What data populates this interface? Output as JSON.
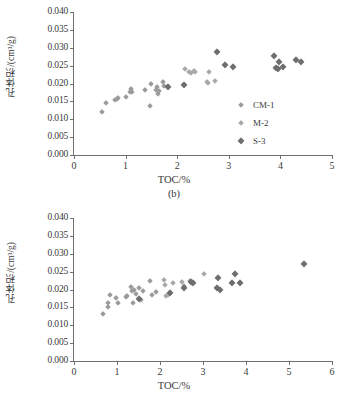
{
  "figure": {
    "series_colors": {
      "CM-1": "#9b9b9b",
      "M-2": "#a9a9a9",
      "S-3": "#6e6e6e"
    }
  },
  "panel_b": {
    "caption": "(b)",
    "legend_title": "",
    "chart_data": {
      "type": "scatter",
      "title": "",
      "xlabel": "TOC/%",
      "ylabel": "孔体积/(cm³/g)",
      "xlim": [
        0,
        5
      ],
      "ylim": [
        0,
        0.04
      ],
      "xticks": [
        "0",
        "1",
        "2",
        "3",
        "4",
        "5"
      ],
      "xtick_values": [
        0,
        1,
        2,
        3,
        4,
        5
      ],
      "yticks": [
        "0.000",
        "0.005",
        "0.010",
        "0.015",
        "0.020",
        "0.025",
        "0.030",
        "0.035",
        "0.040"
      ],
      "ytick_values": [
        0.0,
        0.005,
        0.01,
        0.015,
        0.02,
        0.025,
        0.03,
        0.035,
        0.04
      ],
      "grid": false,
      "legend_position": "right-middle",
      "series": [
        {
          "name": "CM-1",
          "color": "#9b9b9b",
          "points": [
            [
              0.55,
              0.0121
            ],
            [
              0.62,
              0.0145
            ],
            [
              0.8,
              0.0153
            ],
            [
              0.83,
              0.0157
            ],
            [
              0.85,
              0.016
            ],
            [
              1.0,
              0.0161
            ],
            [
              1.08,
              0.0175
            ],
            [
              1.1,
              0.0185
            ],
            [
              1.12,
              0.0177
            ],
            [
              1.38,
              0.0181
            ],
            [
              1.48,
              0.0136
            ],
            [
              1.5,
              0.0198
            ],
            [
              1.58,
              0.0183
            ],
            [
              1.6,
              0.019
            ],
            [
              1.62,
              0.0172
            ],
            [
              1.64,
              0.018
            ],
            [
              1.72,
              0.0204
            ],
            [
              1.75,
              0.0194
            ]
          ]
        },
        {
          "name": "M-2",
          "color": "#a9a9a9",
          "points": [
            [
              2.15,
              0.0241
            ],
            [
              2.22,
              0.0233
            ],
            [
              2.26,
              0.023
            ],
            [
              2.32,
              0.0236
            ],
            [
              2.35,
              0.0231
            ],
            [
              2.58,
              0.0205
            ],
            [
              2.6,
              0.0201
            ],
            [
              2.62,
              0.0231
            ],
            [
              2.74,
              0.0207
            ]
          ]
        },
        {
          "name": "S-3",
          "color": "#6e6e6e",
          "points": [
            [
              1.82,
              0.0189
            ],
            [
              2.14,
              0.0195
            ],
            [
              2.78,
              0.0288
            ],
            [
              2.92,
              0.0252
            ],
            [
              3.08,
              0.0245
            ],
            [
              3.88,
              0.0277
            ],
            [
              3.92,
              0.0243
            ],
            [
              3.95,
              0.0241
            ],
            [
              3.98,
              0.0259
            ],
            [
              4.05,
              0.0245
            ],
            [
              4.3,
              0.0267
            ],
            [
              4.4,
              0.0261
            ]
          ]
        }
      ]
    }
  },
  "panel_c": {
    "caption": "(c)",
    "chart_data": {
      "type": "scatter",
      "title": "",
      "xlabel": "TOC/%",
      "ylabel": "孔体积/(cm³/g)",
      "xlim": [
        0,
        6
      ],
      "ylim": [
        0,
        0.04
      ],
      "xticks": [
        "0",
        "1",
        "2",
        "3",
        "4",
        "5",
        "6"
      ],
      "xtick_values": [
        0,
        1,
        2,
        3,
        4,
        5,
        6
      ],
      "yticks": [
        "0.000",
        "0.005",
        "0.010",
        "0.015",
        "0.020",
        "0.025",
        "0.030",
        "0.035",
        "0.040"
      ],
      "ytick_values": [
        0.0,
        0.005,
        0.01,
        0.015,
        0.02,
        0.025,
        0.03,
        0.035,
        0.04
      ],
      "grid": false,
      "legend_position": "right-middle",
      "series": [
        {
          "name": "CM-1",
          "color": "#9b9b9b",
          "points": [
            [
              0.68,
              0.0131
            ],
            [
              0.78,
              0.0163
            ],
            [
              0.8,
              0.015
            ],
            [
              0.84,
              0.0186
            ],
            [
              0.98,
              0.0176
            ],
            [
              1.02,
              0.0163
            ],
            [
              1.2,
              0.018
            ],
            [
              1.24,
              0.0183
            ],
            [
              1.32,
              0.0206
            ],
            [
              1.35,
              0.0196
            ],
            [
              1.38,
              0.0161
            ],
            [
              1.4,
              0.02
            ],
            [
              1.45,
              0.0188
            ],
            [
              1.52,
              0.0204
            ],
            [
              1.56,
              0.0172
            ],
            [
              1.6,
              0.0196
            ],
            [
              1.76,
              0.0224
            ],
            [
              1.82,
              0.0186
            ],
            [
              1.9,
              0.0194
            ]
          ]
        },
        {
          "name": "M-2",
          "color": "#a9a9a9",
          "points": [
            [
              2.1,
              0.0226
            ],
            [
              2.12,
              0.0213
            ],
            [
              2.14,
              0.0181
            ],
            [
              2.18,
              0.0185
            ],
            [
              2.3,
              0.0219
            ],
            [
              2.52,
              0.0222
            ],
            [
              2.56,
              0.021
            ],
            [
              2.7,
              0.0224
            ],
            [
              3.02,
              0.0243
            ]
          ]
        },
        {
          "name": "S-3",
          "color": "#6e6e6e",
          "points": [
            [
              1.5,
              0.0174
            ],
            [
              2.24,
              0.019
            ],
            [
              2.56,
              0.0203
            ],
            [
              2.72,
              0.0222
            ],
            [
              2.76,
              0.0217
            ],
            [
              3.33,
              0.0203
            ],
            [
              3.36,
              0.0233
            ],
            [
              3.4,
              0.0199
            ],
            [
              3.68,
              0.0217
            ],
            [
              3.74,
              0.0243
            ],
            [
              3.86,
              0.0218
            ],
            [
              5.35,
              0.0271
            ]
          ]
        }
      ]
    }
  }
}
